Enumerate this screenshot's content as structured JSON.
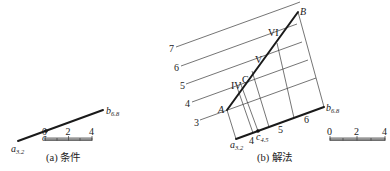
{
  "figure_a": {
    "caption": "(a) 条件",
    "point_a": {
      "name": "a",
      "sub": "3.2"
    },
    "point_b": {
      "name": "b",
      "sub": "6.8"
    },
    "point_c": {
      "name": "c"
    },
    "scale": {
      "ticks": [
        "0",
        "2",
        "4"
      ]
    }
  },
  "figure_b": {
    "caption": "(b) 解法",
    "point_a": {
      "name": "a",
      "sub": "3.2"
    },
    "point_b": {
      "name": "b",
      "sub": "6.8"
    },
    "point_c": {
      "name": "c",
      "sub": "4.5"
    },
    "point_A": "A",
    "point_B": "B",
    "point_C": "C",
    "level_labels": [
      "3",
      "4",
      "5",
      "6",
      "7"
    ],
    "base_ticks": [
      "4",
      "5",
      "6"
    ],
    "roman_labels": [
      "IV",
      "V",
      "VI"
    ],
    "scale": {
      "ticks": [
        "0",
        "2",
        "4"
      ]
    }
  }
}
